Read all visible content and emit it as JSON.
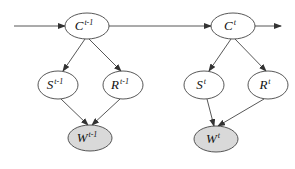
{
  "diagram": {
    "type": "dynamic-bayesian-network",
    "colors": {
      "node_fill": "#ffffff",
      "observed_fill": "#d9d9d9",
      "stroke": "#444444",
      "text": "#111111"
    },
    "nodes": [
      {
        "id": "C_prev",
        "base": "C",
        "sup": "t-1",
        "cx": 87,
        "cy": 26,
        "rx": 22,
        "ry": 13,
        "observed": false
      },
      {
        "id": "C_cur",
        "base": "C",
        "sup": "t",
        "cx": 233,
        "cy": 26,
        "rx": 22,
        "ry": 13,
        "observed": false
      },
      {
        "id": "S_prev",
        "base": "S",
        "sup": "t-1",
        "cx": 58,
        "cy": 85,
        "rx": 20,
        "ry": 14,
        "observed": false
      },
      {
        "id": "R_prev",
        "base": "R",
        "sup": "t-1",
        "cx": 123,
        "cy": 85,
        "rx": 20,
        "ry": 14,
        "observed": false
      },
      {
        "id": "S_cur",
        "base": "S",
        "sup": "t",
        "cx": 204,
        "cy": 85,
        "rx": 20,
        "ry": 14,
        "observed": false
      },
      {
        "id": "R_cur",
        "base": "R",
        "sup": "t",
        "cx": 268,
        "cy": 85,
        "rx": 20,
        "ry": 14,
        "observed": false
      },
      {
        "id": "W_prev",
        "base": "W",
        "sup": "t-1",
        "cx": 90,
        "cy": 138,
        "rx": 22,
        "ry": 13,
        "observed": true
      },
      {
        "id": "W_cur",
        "base": "W",
        "sup": "t",
        "cx": 216,
        "cy": 139,
        "rx": 22,
        "ry": 13,
        "observed": true
      }
    ],
    "edges": [
      {
        "from": "input",
        "to": "C_prev",
        "x1": 14,
        "y1": 26,
        "x2": 65,
        "y2": 26
      },
      {
        "from": "C_prev",
        "to": "C_cur",
        "x1": 109,
        "y1": 26,
        "x2": 211,
        "y2": 26
      },
      {
        "from": "C_cur",
        "to": "output",
        "x1": 255,
        "y1": 26,
        "x2": 281,
        "y2": 26
      },
      {
        "from": "C_prev",
        "to": "S_prev",
        "x1": 85,
        "y1": 39,
        "x2": 63,
        "y2": 71
      },
      {
        "from": "C_prev",
        "to": "R_prev",
        "x1": 89,
        "y1": 39,
        "x2": 121,
        "y2": 71
      },
      {
        "from": "C_cur",
        "to": "S_cur",
        "x1": 231,
        "y1": 39,
        "x2": 209,
        "y2": 71
      },
      {
        "from": "C_cur",
        "to": "R_cur",
        "x1": 235,
        "y1": 39,
        "x2": 266,
        "y2": 71
      },
      {
        "from": "S_prev",
        "to": "W_prev",
        "x1": 61,
        "y1": 99,
        "x2": 88,
        "y2": 125
      },
      {
        "from": "R_prev",
        "to": "W_prev",
        "x1": 120,
        "y1": 99,
        "x2": 92,
        "y2": 125
      },
      {
        "from": "S_cur",
        "to": "W_cur",
        "x1": 207,
        "y1": 99,
        "x2": 214,
        "y2": 126
      },
      {
        "from": "R_cur",
        "to": "W_cur",
        "x1": 264,
        "y1": 99,
        "x2": 218,
        "y2": 126
      }
    ]
  }
}
